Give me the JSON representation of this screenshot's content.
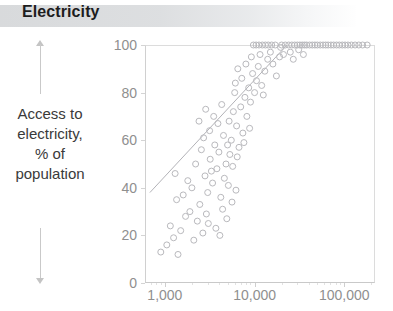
{
  "header": {
    "title": "Electricity",
    "band_color": "#d6d8da"
  },
  "side_caption": {
    "lines": [
      "Access to",
      "electricity,",
      "% of",
      "population"
    ],
    "arrow_up": "up-arrow-icon",
    "arrow_down": "down-arrow-icon",
    "arrow_color": "#c4c4c4"
  },
  "chart_data": {
    "type": "scatter",
    "title": "Electricity",
    "xlabel": "",
    "ylabel": "Access to electricity, % of population",
    "xscale": "log",
    "xlim": [
      600,
      220000
    ],
    "ylim": [
      0,
      100
    ],
    "grid": false,
    "legend": null,
    "axis_color": "#8f8f8f",
    "marker_color": "#b9b9bd",
    "trend_color": "#b3b3b8",
    "yticks": [
      0,
      20,
      40,
      60,
      80,
      100
    ],
    "ytick_labels": [
      "0",
      "20",
      "40",
      "60",
      "80",
      "100"
    ],
    "xticks": [
      1000,
      10000,
      100000
    ],
    "xtick_labels": [
      "1,000",
      "10,000",
      "100,000"
    ],
    "trendline": {
      "x": [
        680,
        23000
      ],
      "y": [
        38,
        100
      ]
    },
    "points": [
      [
        900,
        13
      ],
      [
        1050,
        16
      ],
      [
        1250,
        19
      ],
      [
        1150,
        24
      ],
      [
        1400,
        12
      ],
      [
        1500,
        22
      ],
      [
        1700,
        28
      ],
      [
        1350,
        35
      ],
      [
        1900,
        30
      ],
      [
        2100,
        18
      ],
      [
        2300,
        26
      ],
      [
        2000,
        40
      ],
      [
        2450,
        33
      ],
      [
        2650,
        21
      ],
      [
        2800,
        45
      ],
      [
        3000,
        38
      ],
      [
        3200,
        52
      ],
      [
        2900,
        29
      ],
      [
        3400,
        42
      ],
      [
        3600,
        58
      ],
      [
        3150,
        64
      ],
      [
        3800,
        48
      ],
      [
        4000,
        55
      ],
      [
        4200,
        36
      ],
      [
        3500,
        70
      ],
      [
        4500,
        62
      ],
      [
        4800,
        50
      ],
      [
        4300,
        75
      ],
      [
        5000,
        58
      ],
      [
        5200,
        68
      ],
      [
        4600,
        44
      ],
      [
        5500,
        60
      ],
      [
        5800,
        72
      ],
      [
        5300,
        54
      ],
      [
        6000,
        80
      ],
      [
        6300,
        66
      ],
      [
        6700,
        57
      ],
      [
        6100,
        84
      ],
      [
        7000,
        74
      ],
      [
        7400,
        63
      ],
      [
        6500,
        90
      ],
      [
        7800,
        78
      ],
      [
        8200,
        70
      ],
      [
        7200,
        86
      ],
      [
        8600,
        82
      ],
      [
        9000,
        76
      ],
      [
        8000,
        92
      ],
      [
        9500,
        88
      ],
      [
        10000,
        80
      ],
      [
        9200,
        95
      ],
      [
        10500,
        85
      ],
      [
        11000,
        91
      ],
      [
        12000,
        83
      ],
      [
        11500,
        96
      ],
      [
        13000,
        89
      ],
      [
        14000,
        94
      ],
      [
        12500,
        79
      ],
      [
        15000,
        97
      ],
      [
        16000,
        92
      ],
      [
        17500,
        87
      ],
      [
        19000,
        95
      ],
      [
        2200,
        50
      ],
      [
        2700,
        61
      ],
      [
        3300,
        47
      ],
      [
        3900,
        67
      ],
      [
        4400,
        31
      ],
      [
        5100,
        41
      ],
      [
        5700,
        49
      ],
      [
        6400,
        53
      ],
      [
        7600,
        59
      ],
      [
        8800,
        65
      ],
      [
        1800,
        43
      ],
      [
        2550,
        56
      ],
      [
        3050,
        25
      ],
      [
        3700,
        23
      ],
      [
        4100,
        20
      ],
      [
        4900,
        27
      ],
      [
        5600,
        34
      ],
      [
        6200,
        39
      ],
      [
        2400,
        68
      ],
      [
        2850,
        73
      ],
      [
        1600,
        37
      ],
      [
        1300,
        46
      ],
      [
        20000,
        100
      ],
      [
        22000,
        100
      ],
      [
        24000,
        100
      ],
      [
        26000,
        100
      ],
      [
        28000,
        100
      ],
      [
        30000,
        100
      ],
      [
        32000,
        100
      ],
      [
        34000,
        100
      ],
      [
        36000,
        100
      ],
      [
        38000,
        100
      ],
      [
        41000,
        100
      ],
      [
        44000,
        100
      ],
      [
        47000,
        100
      ],
      [
        50000,
        100
      ],
      [
        54000,
        100
      ],
      [
        58000,
        100
      ],
      [
        62000,
        100
      ],
      [
        66000,
        100
      ],
      [
        71000,
        100
      ],
      [
        76000,
        100
      ],
      [
        82000,
        100
      ],
      [
        88000,
        100
      ],
      [
        95000,
        100
      ],
      [
        102000,
        100
      ],
      [
        110000,
        100
      ],
      [
        120000,
        100
      ],
      [
        132000,
        100
      ],
      [
        145000,
        100
      ],
      [
        160000,
        100
      ],
      [
        180000,
        100
      ],
      [
        17000,
        100
      ],
      [
        15500,
        100
      ],
      [
        14200,
        100
      ],
      [
        13200,
        100
      ],
      [
        12200,
        100
      ],
      [
        11200,
        100
      ],
      [
        10400,
        100
      ],
      [
        9700,
        100
      ],
      [
        31000,
        98
      ],
      [
        25000,
        97
      ],
      [
        21000,
        96
      ],
      [
        19500,
        99
      ],
      [
        27000,
        94
      ],
      [
        35000,
        96
      ]
    ]
  }
}
